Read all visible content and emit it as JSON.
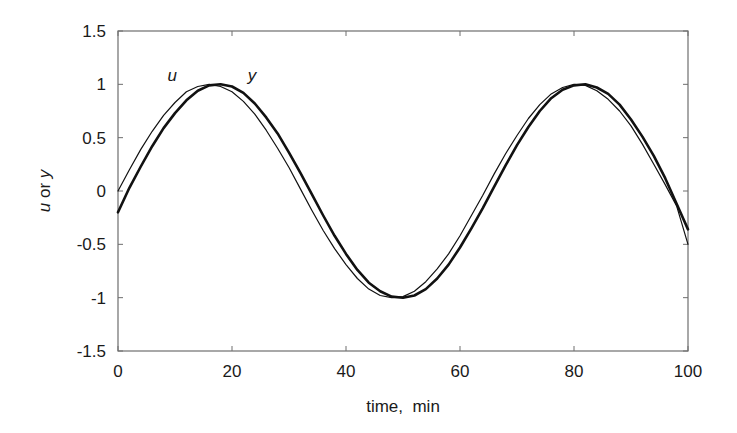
{
  "chart_data": {
    "type": "line",
    "title": "",
    "xlabel": "time,  min",
    "ylabel_parts": [
      {
        "text": "u",
        "italic": true
      },
      {
        "text": " or ",
        "italic": false
      },
      {
        "text": "y",
        "italic": true
      }
    ],
    "ylabel": "u or y",
    "xlim": [
      0,
      100
    ],
    "ylim": [
      -1.5,
      1.5
    ],
    "xticks": [
      0,
      20,
      40,
      60,
      80,
      100
    ],
    "xtick_labels": [
      "0",
      "20",
      "40",
      "60",
      "80",
      "100"
    ],
    "yticks": [
      1.5,
      1,
      0.5,
      0,
      -0.5,
      -1,
      -1.5
    ],
    "ytick_labels": [
      "1.5",
      "1",
      "0.5",
      "0",
      "-0.5",
      "-1",
      "-1.5"
    ],
    "grid": false,
    "legend": "none (inline curve labels)",
    "annotations": [
      {
        "text": "u",
        "x": 9.5,
        "y": 1.03,
        "italic": true
      },
      {
        "text": "y",
        "x": 23.5,
        "y": 1.03,
        "italic": true
      }
    ],
    "series": [
      {
        "name": "u",
        "style": "thin",
        "x": [
          0,
          2,
          4,
          6,
          8,
          10,
          12,
          14,
          16,
          18,
          20,
          22,
          24,
          26,
          28,
          30,
          32,
          34,
          36,
          38,
          40,
          42,
          44,
          46,
          48,
          50,
          52,
          54,
          56,
          58,
          60,
          62,
          64,
          66,
          68,
          70,
          72,
          74,
          76,
          78,
          80,
          82,
          84,
          86,
          88,
          90,
          92,
          94,
          96,
          98,
          100
        ],
        "values": [
          0.0,
          0.2,
          0.39,
          0.56,
          0.71,
          0.83,
          0.93,
          0.98,
          1.0,
          0.98,
          0.93,
          0.84,
          0.72,
          0.57,
          0.4,
          0.22,
          0.02,
          -0.18,
          -0.37,
          -0.54,
          -0.69,
          -0.82,
          -0.92,
          -0.98,
          -1.0,
          -0.99,
          -0.94,
          -0.85,
          -0.73,
          -0.59,
          -0.42,
          -0.23,
          -0.04,
          0.16,
          0.35,
          0.52,
          0.68,
          0.81,
          0.91,
          0.97,
          1.0,
          0.99,
          0.94,
          0.86,
          0.75,
          0.61,
          0.44,
          0.25,
          0.06,
          -0.14,
          -0.5
        ]
      },
      {
        "name": "y",
        "style": "thick",
        "x": [
          0,
          2,
          4,
          6,
          8,
          10,
          12,
          14,
          16,
          18,
          20,
          22,
          24,
          26,
          28,
          30,
          32,
          34,
          36,
          38,
          40,
          42,
          44,
          46,
          48,
          50,
          52,
          54,
          56,
          58,
          60,
          62,
          64,
          66,
          68,
          70,
          72,
          74,
          76,
          78,
          80,
          82,
          84,
          86,
          88,
          90,
          92,
          94,
          96,
          98,
          100
        ],
        "values": [
          -0.2,
          0.03,
          0.23,
          0.42,
          0.59,
          0.73,
          0.85,
          0.94,
          0.99,
          1.0,
          0.98,
          0.92,
          0.82,
          0.69,
          0.54,
          0.36,
          0.17,
          -0.03,
          -0.23,
          -0.42,
          -0.59,
          -0.74,
          -0.86,
          -0.94,
          -0.99,
          -1.0,
          -0.98,
          -0.92,
          -0.82,
          -0.69,
          -0.53,
          -0.35,
          -0.16,
          0.04,
          0.24,
          0.43,
          0.6,
          0.75,
          0.87,
          0.95,
          0.99,
          1.0,
          0.97,
          0.91,
          0.81,
          0.67,
          0.51,
          0.33,
          0.12,
          -0.12,
          -0.36
        ]
      }
    ]
  },
  "plot_area": {
    "left": 118,
    "right": 688,
    "top": 31,
    "bottom": 351
  }
}
